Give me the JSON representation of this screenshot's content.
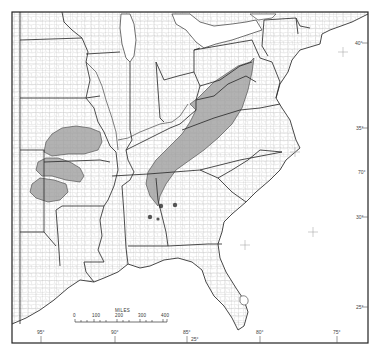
{
  "map": {
    "title": "",
    "region": "Eastern United States",
    "colors": {
      "background": "#ffffff",
      "frame": "#222222",
      "state_border": "#333333",
      "county_border": "#9a9a9a",
      "shaded_region": "#a8a8a8",
      "shaded_region_dark": "#8e8e8e",
      "water": "#ffffff"
    },
    "scale_bar": {
      "title": "MILES",
      "ticks": [
        "0",
        "100",
        "200",
        "300",
        "400"
      ]
    },
    "longitude_labels": [
      "95°",
      "90°",
      "85°",
      "80°",
      "75°"
    ],
    "latitude_labels": [
      "40°",
      "35°",
      "30°",
      "25°"
    ],
    "corner_labels": {
      "bottom": "25°",
      "right": "70°"
    },
    "shaded_regions": [
      {
        "name": "appalachian-basin",
        "description": "Appalachian region from Pennsylvania to Alabama"
      },
      {
        "name": "western-interior-north",
        "description": "Missouri / Kansas area"
      },
      {
        "name": "western-interior-middle",
        "description": "Oklahoma / Arkansas area"
      },
      {
        "name": "western-interior-south",
        "description": "Oklahoma area"
      }
    ],
    "point_markers": 4
  }
}
